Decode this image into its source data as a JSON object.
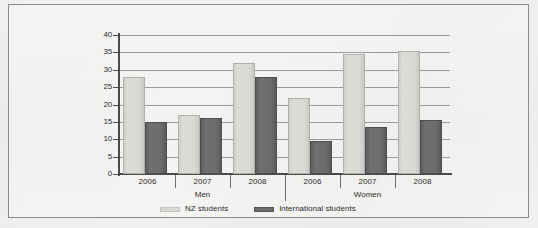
{
  "figure": {
    "caption": ""
  },
  "legend": {
    "position": "bottom-center",
    "items": [
      {
        "label": "NZ students",
        "swatch": "nz",
        "color": "#d9d9d6"
      },
      {
        "label": "International students",
        "swatch": "intl",
        "color": "#6c6c6c"
      }
    ]
  },
  "axis": {
    "y_ticks": [
      "0",
      "5",
      "10",
      "15",
      "20",
      "25",
      "30",
      "35",
      "40"
    ]
  },
  "groups": [
    {
      "name": "Men",
      "years": [
        "2006",
        "2007",
        "2008"
      ]
    },
    {
      "name": "Women",
      "years": [
        "2006",
        "2007",
        "2008"
      ]
    }
  ],
  "chart_data": {
    "type": "bar",
    "title": "",
    "xlabel": "",
    "ylabel": "",
    "ylim": [
      0,
      40
    ],
    "ytick_step": 5,
    "grid": true,
    "grid_axis": "y",
    "legend_position": "bottom-center",
    "group_labels": [
      "Men",
      "Women"
    ],
    "categories": [
      "Men 2006",
      "Men 2007",
      "Men 2008",
      "Women 2006",
      "Women 2007",
      "Women 2008"
    ],
    "x": [
      "2006",
      "2007",
      "2008",
      "2006",
      "2007",
      "2008"
    ],
    "series": [
      {
        "name": "NZ students",
        "color": "#d9d9d6",
        "values": [
          28,
          17,
          32,
          22,
          34.5,
          35.5
        ]
      },
      {
        "name": "International students",
        "color": "#6c6c6c",
        "values": [
          15,
          16,
          28,
          9.5,
          13.5,
          15.5
        ]
      }
    ]
  }
}
